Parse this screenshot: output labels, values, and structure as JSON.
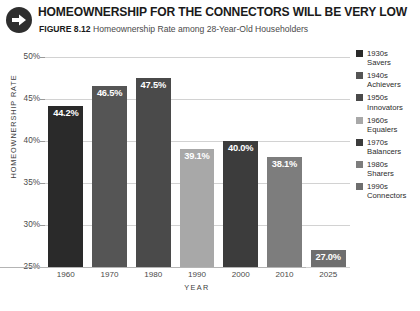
{
  "header": {
    "title": "HOMEOWNERSHIP FOR THE CONNECTORS WILL BE VERY LOW",
    "figure_number": "FIGURE 8.12",
    "figure_subtitle": "Homeownership Rate among 28-Year-Old Householders",
    "arrow_icon": "arrow-right-circle-icon"
  },
  "bottom_caption": "",
  "chart_data": {
    "type": "bar",
    "title": "Homeownership Rate among 28-Year-Old Householders",
    "xlabel": "YEAR",
    "ylabel": "HOMEOWNERSHIP RATE",
    "categories": [
      "1960",
      "1970",
      "1980",
      "1990",
      "2000",
      "2010",
      "2025"
    ],
    "values": [
      44.2,
      46.5,
      47.5,
      39.1,
      40.0,
      38.1,
      27.0
    ],
    "value_labels": [
      "44.2%",
      "46.5%",
      "47.5%",
      "39.1%",
      "40.0%",
      "38.1%",
      "27.0%"
    ],
    "bar_colors": [
      "#2a2a2a",
      "#555555",
      "#4a4a4a",
      "#a8a8a8",
      "#3c3c3c",
      "#7d7d7d",
      "#6e6e6e"
    ],
    "ylim": [
      25,
      50
    ],
    "yticks": [
      25,
      30,
      35,
      40,
      45,
      50
    ],
    "ytick_labels": [
      "25%",
      "30%",
      "35%",
      "40%",
      "45%",
      "50%"
    ],
    "grid": true,
    "legend_position": "right"
  },
  "legend": {
    "items": [
      {
        "decade": "1930s",
        "name": "Savers",
        "color": "#2a2a2a"
      },
      {
        "decade": "1940s",
        "name": "Achievers",
        "color": "#555555"
      },
      {
        "decade": "1950s",
        "name": "Innovators",
        "color": "#4a4a4a"
      },
      {
        "decade": "1960s",
        "name": "Equalers",
        "color": "#a8a8a8"
      },
      {
        "decade": "1970s",
        "name": "Balancers",
        "color": "#3c3c3c"
      },
      {
        "decade": "1980s",
        "name": "Sharers",
        "color": "#7d7d7d"
      },
      {
        "decade": "1990s",
        "name": "Connectors",
        "color": "#6e6e6e"
      }
    ]
  }
}
